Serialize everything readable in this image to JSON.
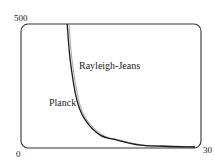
{
  "chart_data": {
    "type": "line",
    "title": "",
    "xlabel": "",
    "ylabel": "",
    "xlim": [
      0,
      30
    ],
    "ylim": [
      0,
      500
    ],
    "grid": false,
    "legend": "inline labels",
    "tick_labels": {
      "x": [
        "0",
        "30"
      ],
      "y": [
        "0",
        "500"
      ]
    },
    "series": [
      {
        "name": "Planck",
        "color": "#1a1a1a",
        "x": [
          7.7,
          8.2,
          9.3,
          10.7,
          13.2,
          16.0,
          19.8,
          24.0,
          29.0
        ],
        "y": [
          500,
          355,
          194,
          113,
          52,
          32,
          12,
          7,
          4
        ]
      },
      {
        "name": "Rayleigh-Jeans",
        "color": "#a0a0a0",
        "x": [
          8.0,
          8.5,
          9.6,
          11.0,
          13.6,
          16.4,
          20.0,
          24.0,
          29.0
        ],
        "y": [
          500,
          355,
          194,
          113,
          52,
          32,
          13,
          8,
          5
        ]
      }
    ],
    "annotations": [
      {
        "text": "Rayleigh-Jeans",
        "x": 9.7,
        "y": 315
      },
      {
        "text": "Planck",
        "x": 4.7,
        "y": 165
      }
    ]
  },
  "labels": {
    "y_max": "500",
    "origin": "0",
    "x_max": "30",
    "rayleigh_jeans": "Rayleigh-Jeans",
    "planck": "Planck"
  }
}
